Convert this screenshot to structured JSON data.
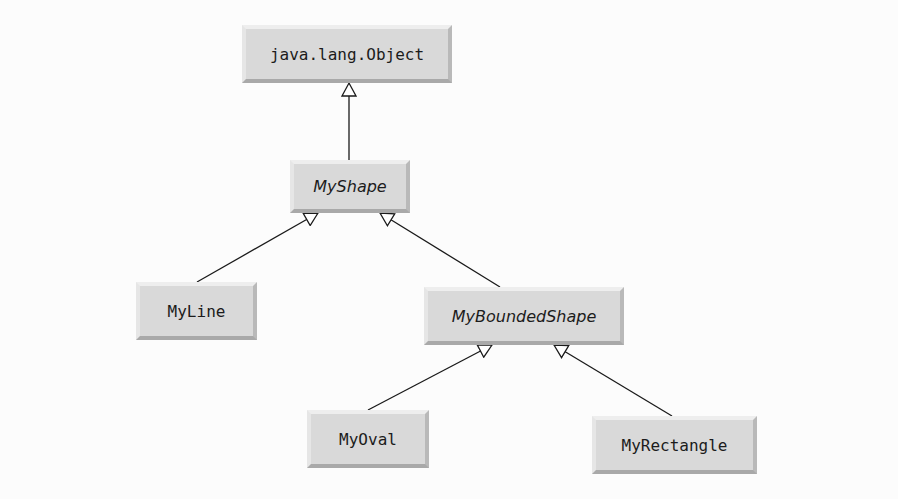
{
  "diagram": {
    "type": "uml-class-hierarchy",
    "nodes": [
      {
        "id": "object",
        "label": "java.lang.Object",
        "abstract": false
      },
      {
        "id": "myshape",
        "label": "MyShape",
        "abstract": true
      },
      {
        "id": "myline",
        "label": "MyLine",
        "abstract": false
      },
      {
        "id": "myboundedshape",
        "label": "MyBoundedShape",
        "abstract": true
      },
      {
        "id": "myoval",
        "label": "MyOval",
        "abstract": false
      },
      {
        "id": "myrectangle",
        "label": "MyRectangle",
        "abstract": false
      }
    ],
    "edges": [
      {
        "from": "myshape",
        "to": "object",
        "kind": "generalization"
      },
      {
        "from": "myline",
        "to": "myshape",
        "kind": "generalization"
      },
      {
        "from": "myboundedshape",
        "to": "myshape",
        "kind": "generalization"
      },
      {
        "from": "myoval",
        "to": "myboundedshape",
        "kind": "generalization"
      },
      {
        "from": "myrectangle",
        "to": "myboundedshape",
        "kind": "generalization"
      }
    ],
    "colors": {
      "box": "#d9d9d9",
      "line": "#1a1a1a",
      "background": "#fcfcfc"
    }
  }
}
